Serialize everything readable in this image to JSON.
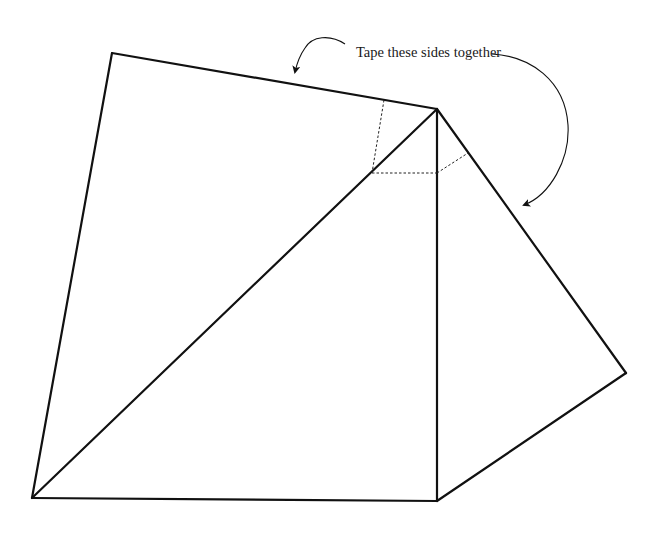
{
  "diagram": {
    "annotation": {
      "text": "Tape these sides together",
      "x": 356,
      "y": 44
    },
    "colors": {
      "line": "#111111",
      "dashed": "#222222",
      "background": "#ffffff"
    },
    "vertices": {
      "top_left": [
        112,
        53
      ],
      "apex": [
        437,
        109
      ],
      "right": [
        626,
        373
      ],
      "bottom_right": [
        437,
        501
      ],
      "bottom_left": [
        32,
        498
      ]
    },
    "solid_edges": [
      [
        "bottom_left",
        "top_left"
      ],
      [
        "top_left",
        "apex"
      ],
      [
        "apex",
        "bottom_left"
      ],
      [
        "apex",
        "bottom_right"
      ],
      [
        "bottom_left",
        "bottom_right"
      ],
      [
        "apex",
        "right"
      ],
      [
        "right",
        "bottom_right"
      ]
    ],
    "dashed_lines": [
      [
        [
          384,
          100
        ],
        [
          372,
          173
        ]
      ],
      [
        [
          372,
          173
        ],
        [
          437,
          173
        ]
      ],
      [
        [
          437,
          173
        ],
        [
          468,
          153
        ]
      ]
    ],
    "arrows": [
      {
        "name": "left-arrow",
        "path": "M345,44 C330,34 312,36 305,48 C300,55 297,63 295,72",
        "head": [
          294,
          73
        ]
      },
      {
        "name": "right-arrow",
        "path": "M492,54 C530,56 565,80 568,125 C570,160 550,195 524,205",
        "head": [
          523,
          205
        ]
      }
    ]
  }
}
